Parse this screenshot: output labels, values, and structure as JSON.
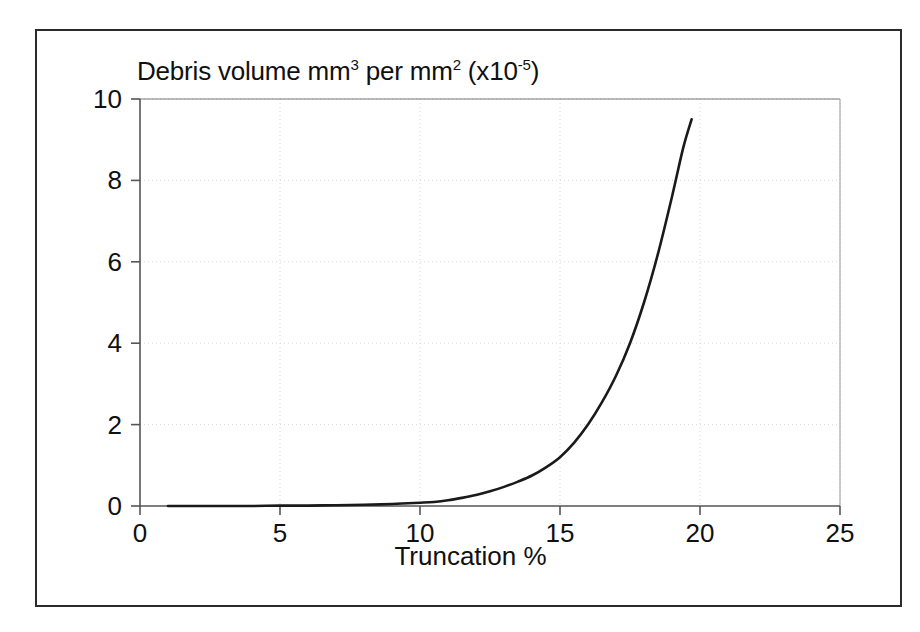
{
  "chart_data": {
    "type": "line",
    "title": "Debris volume mm3 per mm2 (x10-5)",
    "title_parts": {
      "lead": "Debris volume mm",
      "sup1": "3",
      "mid": " per mm",
      "sup2": "2",
      "tail_open": " (x10",
      "sup3": "-5",
      "tail_close": ")"
    },
    "xlabel": "Truncation %",
    "ylabel": "",
    "xlim": [
      0,
      25
    ],
    "ylim": [
      0,
      10
    ],
    "xticks": [
      "0",
      "5",
      "10",
      "15",
      "20",
      "25"
    ],
    "xtick_values": [
      0,
      5,
      10,
      15,
      20,
      25
    ],
    "yticks": [
      "0",
      "2",
      "4",
      "6",
      "8",
      "10"
    ],
    "ytick_values": [
      0,
      2,
      4,
      6,
      8,
      10
    ],
    "grid": true,
    "grid_style": "dotted-light-gray",
    "legend": null,
    "series": [
      {
        "name": "Debris volume",
        "color": "#1a1a1a",
        "x": [
          1.0,
          2.0,
          3.0,
          4.0,
          5.0,
          6.0,
          7.0,
          8.0,
          9.0,
          10.0,
          10.5,
          11.0,
          11.5,
          12.0,
          12.5,
          13.0,
          13.5,
          14.0,
          14.5,
          15.0,
          15.5,
          16.0,
          16.5,
          17.0,
          17.5,
          18.0,
          18.5,
          19.0,
          19.4,
          19.7
        ],
        "values": [
          0.0,
          0.0,
          0.0,
          0.0,
          0.01,
          0.01,
          0.02,
          0.03,
          0.05,
          0.08,
          0.1,
          0.14,
          0.2,
          0.27,
          0.36,
          0.47,
          0.6,
          0.75,
          0.95,
          1.2,
          1.55,
          2.0,
          2.55,
          3.2,
          4.0,
          5.0,
          6.2,
          7.6,
          8.8,
          9.5
        ]
      }
    ]
  },
  "colors": {
    "axis": "#555555",
    "frame": "#2b2b2b",
    "curve": "#1a1a1a",
    "grid": "#d8d8d8",
    "text": "#101010",
    "background": "#ffffff"
  }
}
